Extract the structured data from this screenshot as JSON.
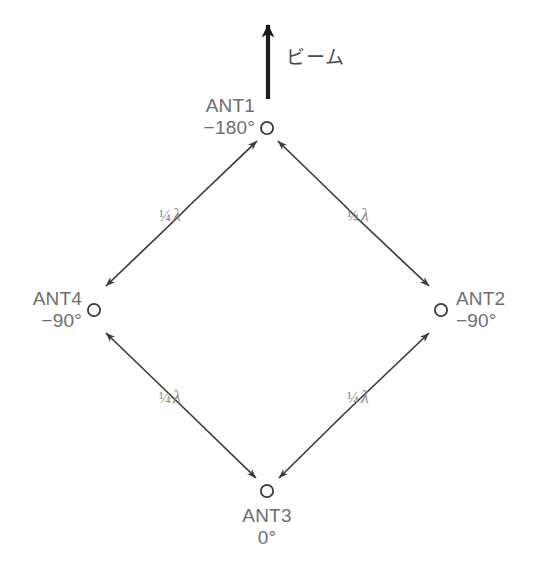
{
  "figure": {
    "type": "antenna-array-diagram",
    "beam": {
      "label": "ビーム",
      "arrow_direction": "up"
    },
    "colors": {
      "line": "#3c3c3c",
      "node_stroke": "#3a3a3a",
      "node_label_text": "#6e6e6e",
      "segment_label_text": "#8a8a8a",
      "beam_label_text": "#4a4a4a",
      "background": "#ffffff"
    },
    "nodes": [
      {
        "id": "ANT1",
        "name": "ANT1",
        "phase": "−180°",
        "position": "top",
        "cx": 267,
        "cy": 128
      },
      {
        "id": "ANT2",
        "name": "ANT2",
        "phase": "−90°",
        "position": "right",
        "cx": 441,
        "cy": 310
      },
      {
        "id": "ANT3",
        "name": "ANT3",
        "phase": "0°",
        "position": "bottom",
        "cx": 267,
        "cy": 491
      },
      {
        "id": "ANT4",
        "name": "ANT4",
        "phase": "−90°",
        "position": "left",
        "cx": 94,
        "cy": 310
      }
    ],
    "segments": [
      {
        "id": "s1",
        "from": "ANT4",
        "to": "ANT1",
        "label_fraction": "¼",
        "label_symbol": "λ",
        "label": "¼ λ",
        "arrows": "both"
      },
      {
        "id": "s2",
        "from": "ANT1",
        "to": "ANT2",
        "label_fraction": "¼",
        "label_symbol": "λ",
        "label": "¼ λ",
        "arrows": "both"
      },
      {
        "id": "s3",
        "from": "ANT4",
        "to": "ANT3",
        "label_fraction": "¼",
        "label_symbol": "λ",
        "label": "¼ λ",
        "arrows": "both"
      },
      {
        "id": "s4",
        "from": "ANT3",
        "to": "ANT2",
        "label_fraction": "¼",
        "label_symbol": "λ",
        "label": "¼ λ",
        "arrows": "both"
      }
    ]
  }
}
